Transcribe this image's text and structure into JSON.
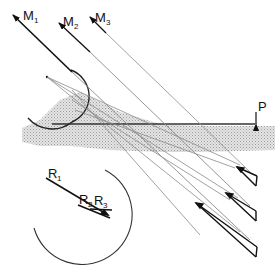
{
  "diagram": {
    "type": "optics-reflection-diagram",
    "labels": {
      "M1": {
        "main": "M",
        "sub": "1"
      },
      "M2": {
        "main": "M",
        "sub": "2"
      },
      "M3": {
        "main": "M",
        "sub": "3"
      },
      "P": "P",
      "R1": {
        "main": "R",
        "sub": "1"
      },
      "R2": {
        "main": "R",
        "sub": "2"
      },
      "R3": {
        "main": "R",
        "sub": "3"
      }
    },
    "colors": {
      "ink": "#111111",
      "ray_light": "#9a9a9a",
      "shade": "#cfcfcf",
      "background": "#ffffff"
    },
    "elements": [
      "incident-ray-M1",
      "incident-ray-M2",
      "incident-ray-M3",
      "hemispherical-reflector",
      "shaded-surface-layer",
      "surface-line",
      "point-P-marker",
      "reflected-ray-triangles",
      "vector-circle-R1-R2-R3"
    ]
  }
}
